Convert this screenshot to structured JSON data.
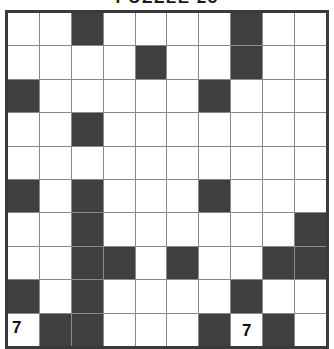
{
  "title": "PUZZLE 25",
  "puzzle": {
    "type": "crossword-grid",
    "rows": 10,
    "cols": 10,
    "colors": {
      "block": "#3f3f3f",
      "empty": "#ffffff",
      "gridline": "#8a8a8a",
      "border": "#3a3a3a",
      "number": "#111111"
    },
    "block_cells": [
      [
        0,
        2
      ],
      [
        0,
        7
      ],
      [
        1,
        4
      ],
      [
        1,
        7
      ],
      [
        2,
        0
      ],
      [
        2,
        6
      ],
      [
        3,
        2
      ],
      [
        5,
        0
      ],
      [
        5,
        2
      ],
      [
        5,
        6
      ],
      [
        6,
        2
      ],
      [
        6,
        9
      ],
      [
        7,
        2
      ],
      [
        7,
        3
      ],
      [
        7,
        5
      ],
      [
        7,
        8
      ],
      [
        7,
        9
      ],
      [
        8,
        0
      ],
      [
        8,
        2
      ],
      [
        8,
        7
      ],
      [
        9,
        1
      ],
      [
        9,
        2
      ],
      [
        9,
        6
      ],
      [
        9,
        8
      ]
    ],
    "clue_numbers": [
      {
        "row": 9,
        "col": 0,
        "label": "7",
        "align": "corner"
      },
      {
        "row": 9,
        "col": 7,
        "label": "7",
        "align": "center"
      }
    ]
  }
}
